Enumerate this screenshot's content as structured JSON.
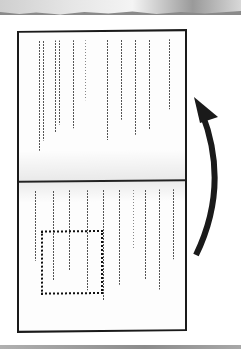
{
  "document": {
    "description": "Scanned folded sheet with two panels of rotated, illegible small text columns",
    "panels": [
      {
        "name": "upper-panel",
        "column_count": 11
      },
      {
        "name": "lower-panel",
        "column_count": 10
      }
    ],
    "placeholder_box": {
      "style": "dotted",
      "label": ""
    },
    "arrow": {
      "direction": "curved-up",
      "color": "#1a1a1a"
    }
  },
  "colors": {
    "sheet_border": "#1a1a1a",
    "text": "#555555",
    "background": "#ffffff"
  }
}
